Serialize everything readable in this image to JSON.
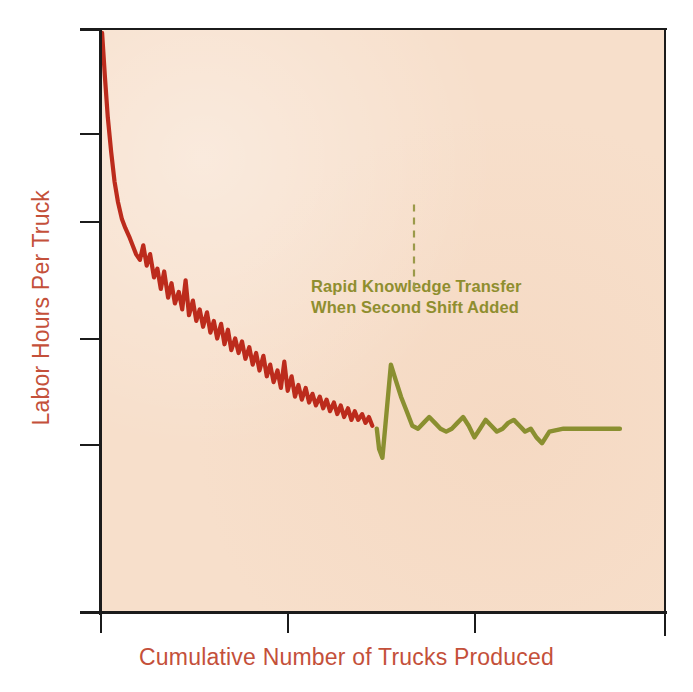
{
  "figure": {
    "background_color": "#ffffff",
    "plot_background_color": "#f7dfcb",
    "frame_color": "#1b1b1b"
  },
  "axes": {
    "y_title": "Labor Hours Per Truck",
    "x_title": "Cumulative Number  of Trucks Produced",
    "label_color": "#c4503a",
    "y_tick_count": 6,
    "x_tick_count": 4,
    "tick_labels_shown": false
  },
  "annotation": {
    "line1": "Rapid Knowledge Transfer",
    "line2": "When Second Shift Added",
    "color": "#8f8e2f",
    "leader_line": "dashed-vertical"
  },
  "series_labels": {
    "first_shift": "First Shift (red)",
    "second_shift": "Second Shift (green)"
  },
  "chart_data": {
    "type": "line",
    "title": "",
    "xlabel": "Cumulative Number  of Trucks Produced",
    "ylabel": "Labor Hours Per Truck",
    "xlim": [
      0,
      100
    ],
    "ylim": [
      0,
      100
    ],
    "grid": false,
    "legend_position": "none",
    "axis_tick_labels": {
      "x": [
        "",
        "",
        "",
        ""
      ],
      "y": [
        "",
        "",
        "",
        "",
        "",
        ""
      ]
    },
    "annotations": [
      {
        "text": "Rapid Knowledge Transfer When Second Shift Added",
        "x": 56,
        "y": 78,
        "color": "#8f8e2f",
        "leader_to": [
          55.5,
          55
        ]
      }
    ],
    "series": [
      {
        "name": "First Shift",
        "color": "#bc2b1c",
        "x": [
          0.2,
          0.7,
          1.2,
          1.8,
          2.4,
          3.0,
          3.7,
          4.3,
          5.0,
          5.6,
          6.2,
          6.9,
          7.5,
          8.1,
          8.7,
          9.4,
          10.0,
          10.6,
          11.2,
          11.9,
          12.5,
          13.1,
          13.8,
          14.4,
          15.0,
          15.6,
          16.3,
          16.9,
          17.5,
          18.1,
          18.8,
          19.4,
          20.0,
          20.6,
          21.3,
          21.9,
          22.5,
          23.1,
          23.8,
          24.4,
          25.0,
          25.6,
          26.3,
          26.9,
          27.5,
          28.1,
          28.8,
          29.4,
          30.0,
          30.6,
          31.3,
          31.9,
          32.5,
          33.1,
          33.8,
          34.4,
          35.0,
          35.6,
          36.3,
          36.9,
          37.5,
          38.1,
          38.8,
          39.4,
          40.0,
          40.6,
          41.3,
          41.9,
          42.5,
          43.1,
          43.8,
          44.4,
          45.0,
          45.6,
          46.3,
          46.9,
          47.5,
          48.1
        ],
        "y": [
          99.5,
          92.0,
          85.0,
          79.0,
          74.0,
          70.5,
          67.5,
          66.0,
          64.5,
          63.0,
          61.5,
          60.5,
          63.0,
          59.5,
          61.5,
          57.5,
          59.0,
          55.5,
          58.5,
          54.0,
          56.5,
          53.0,
          55.0,
          52.0,
          57.0,
          51.0,
          53.5,
          50.0,
          52.0,
          49.0,
          51.5,
          48.0,
          50.0,
          47.0,
          49.5,
          46.0,
          48.5,
          45.0,
          47.0,
          44.5,
          46.5,
          43.5,
          45.5,
          42.5,
          44.5,
          41.5,
          44.0,
          40.5,
          42.5,
          39.5,
          41.5,
          38.5,
          43.0,
          38.0,
          40.5,
          37.0,
          39.0,
          36.5,
          38.5,
          36.0,
          37.5,
          35.5,
          37.0,
          35.0,
          36.5,
          34.5,
          36.0,
          34.0,
          35.5,
          33.5,
          35.0,
          33.0,
          34.5,
          33.0,
          34.0,
          32.5,
          33.5,
          32.0
        ]
      },
      {
        "name": "Second Shift",
        "color": "#8a8f30",
        "x": [
          48.9,
          49.3,
          49.9,
          50.6,
          51.4,
          52.2,
          53.2,
          54.2,
          55.2,
          56.2,
          57.2,
          58.2,
          59.2,
          60.2,
          61.2,
          62.2,
          63.2,
          64.2,
          65.2,
          66.2,
          67.2,
          68.2,
          69.2,
          70.2,
          71.2,
          72.2,
          73.2,
          74.2,
          75.2,
          76.2,
          77.2,
          78.2,
          79.5,
          82.0,
          85.0,
          89.0,
          92.0
        ],
        "y": [
          31.5,
          28.0,
          26.5,
          34.0,
          42.5,
          40.0,
          37.0,
          34.5,
          32.0,
          31.5,
          32.5,
          33.5,
          32.5,
          31.5,
          31.0,
          31.5,
          32.5,
          33.5,
          32.0,
          30.0,
          31.5,
          33.0,
          32.0,
          31.0,
          31.5,
          32.5,
          33.0,
          32.0,
          31.0,
          31.5,
          30.0,
          29.0,
          31.0,
          31.5,
          31.5,
          31.5,
          31.5
        ]
      }
    ]
  }
}
